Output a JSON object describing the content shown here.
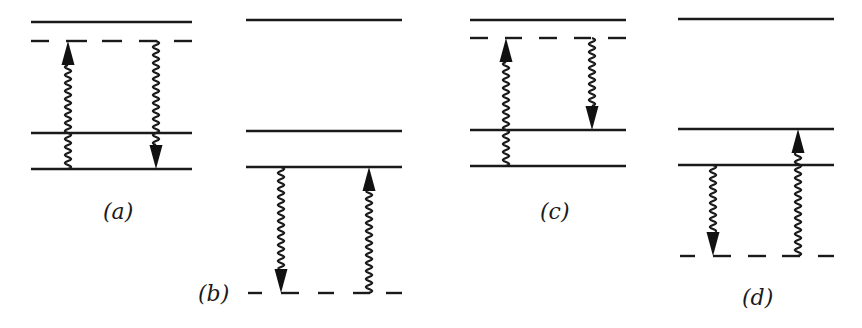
{
  "figure": {
    "colors": {
      "ink": "#1a1a1a",
      "background": "#ffffff"
    },
    "panels": [
      {
        "id": "a",
        "label": "(a)",
        "levels": [
          "upper-real",
          "virtual-upper",
          "middle-real",
          "ground-real"
        ],
        "virtual_level": "above",
        "transitions": [
          {
            "type": "absorption",
            "direction": "up",
            "from": "ground",
            "to": "virtual-upper",
            "style": "wavy-arrow"
          },
          {
            "type": "emission",
            "direction": "down",
            "from": "virtual-upper",
            "to": "ground",
            "style": "wavy-arrow"
          }
        ]
      },
      {
        "id": "b",
        "label": "(b)",
        "levels": [
          "upper-real",
          "middle-real",
          "lower-real",
          "virtual-lower"
        ],
        "virtual_level": "below",
        "transitions": [
          {
            "type": "emission",
            "direction": "down",
            "from": "lower-real",
            "to": "virtual-lower",
            "style": "wavy-arrow"
          },
          {
            "type": "absorption",
            "direction": "up",
            "from": "virtual-lower",
            "to": "lower-real",
            "style": "wavy-arrow"
          }
        ]
      },
      {
        "id": "c",
        "label": "(c)",
        "levels": [
          "upper-real",
          "virtual-upper",
          "middle-real",
          "ground-real"
        ],
        "virtual_level": "above",
        "transitions": [
          {
            "type": "absorption",
            "direction": "up",
            "from": "ground",
            "to": "virtual-upper",
            "style": "wavy-arrow"
          },
          {
            "type": "emission",
            "direction": "down",
            "from": "virtual-upper",
            "to": "middle-real",
            "style": "wavy-arrow"
          }
        ]
      },
      {
        "id": "d",
        "label": "(d)",
        "levels": [
          "upper-real",
          "middle-real",
          "lower-real",
          "virtual-lower"
        ],
        "virtual_level": "below",
        "transitions": [
          {
            "type": "emission",
            "direction": "down",
            "from": "lower-real",
            "to": "virtual-lower",
            "style": "wavy-arrow"
          },
          {
            "type": "absorption",
            "direction": "up",
            "from": "virtual-lower",
            "to": "middle-real",
            "style": "wavy-arrow"
          }
        ]
      }
    ]
  }
}
